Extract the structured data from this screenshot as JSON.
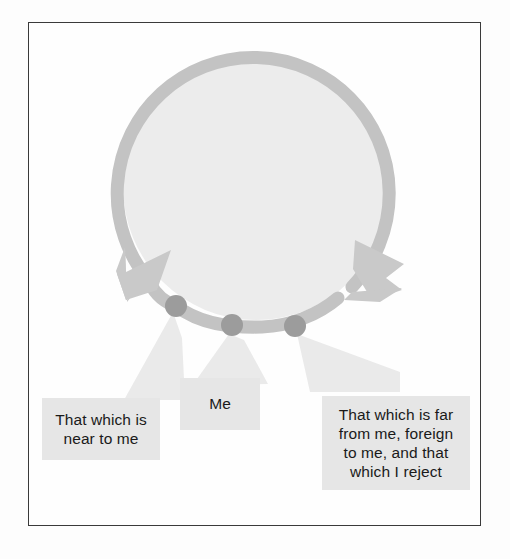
{
  "figure": {
    "type": "diagram",
    "frame": {
      "border_color": "#3a3a3a",
      "background": "#fefefe"
    },
    "ring": {
      "name": "circular-double-arrow",
      "stroke_color": "#c3c3c3",
      "fill_color": "#ececec",
      "center_x": 256,
      "center_y": 187,
      "radius": 136,
      "stroke_width": 13,
      "arrowheads": [
        {
          "name": "left-arrowhead",
          "direction": "counterclockwise",
          "position": "lower-left"
        },
        {
          "name": "right-arrowhead",
          "direction": "clockwise",
          "position": "lower-right"
        }
      ]
    },
    "points": [
      {
        "id": "near",
        "cx": 176,
        "cy": 306,
        "r": 11,
        "color": "#9c9c9c"
      },
      {
        "id": "me",
        "cx": 232,
        "cy": 325,
        "r": 11,
        "color": "#9c9c9c"
      },
      {
        "id": "far",
        "cx": 295,
        "cy": 326,
        "r": 11,
        "color": "#9c9c9c"
      }
    ],
    "callouts": [
      {
        "id": "near",
        "label_lines": [
          "That which is",
          "near to me"
        ],
        "text": "That which is near to me",
        "box_color": "#e6e6e6",
        "text_color": "#1a1a1a"
      },
      {
        "id": "me",
        "label_lines": [
          "Me"
        ],
        "text": "Me",
        "box_color": "#e6e6e6",
        "text_color": "#1a1a1a"
      },
      {
        "id": "far",
        "label_lines": [
          "That which is far",
          "from me, foreign",
          "to me, and that",
          "which I reject"
        ],
        "text": "That which is far from me, foreign to me, and that which I reject",
        "box_color": "#e6e6e6",
        "text_color": "#1a1a1a"
      }
    ]
  }
}
